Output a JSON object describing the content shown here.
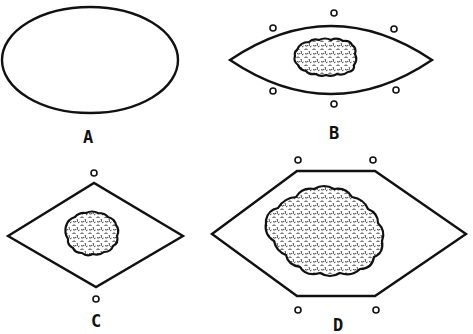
{
  "figure": {
    "panels": [
      {
        "id": "A",
        "label": "A",
        "shape": "ellipse",
        "has_mass": false,
        "marker_count": 0
      },
      {
        "id": "B",
        "label": "B",
        "shape": "lens",
        "has_mass": true,
        "marker_count": 6
      },
      {
        "id": "C",
        "label": "C",
        "shape": "diamond",
        "has_mass": true,
        "marker_count": 2
      },
      {
        "id": "D",
        "label": "D",
        "shape": "hexagon",
        "has_mass": true,
        "marker_count": 4
      }
    ]
  },
  "colors": {
    "line": "#111111",
    "background": "#ffffff"
  }
}
